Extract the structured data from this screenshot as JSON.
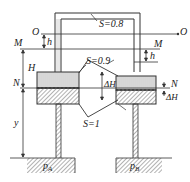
{
  "diagram": {
    "type": "differential manometer / two-reservoir connected tube schematic",
    "labels": {
      "O_left": "O",
      "O_right": "O",
      "M_left": "M",
      "M_right": "M",
      "N_left": "N",
      "N_right": "N",
      "h_left": "h",
      "h_right": "h",
      "H": "H",
      "dH_mid": "ΔH",
      "dH_right": "ΔH",
      "y": "y",
      "pA": "p",
      "pA_sub": "A",
      "pB": "p",
      "pB_sub": "B",
      "S_top": "S=0.8",
      "S_mid": "S=0.9",
      "S_bottom": "S=1"
    },
    "fluids": [
      {
        "name": "upper fluid",
        "specific_gravity": "0.8"
      },
      {
        "name": "middle fluid",
        "specific_gravity": "0.9"
      },
      {
        "name": "lower fluid",
        "specific_gravity": "1"
      }
    ],
    "colors": {
      "line": "#333333",
      "hatch": "#777777",
      "background": "#ffffff"
    }
  }
}
